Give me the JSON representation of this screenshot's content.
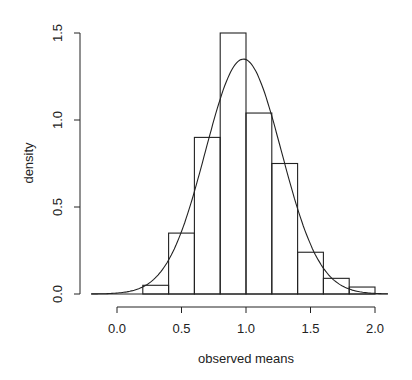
{
  "chart_data": {
    "type": "bar",
    "subtype": "histogram_with_density_curve",
    "title": "",
    "xlabel": "observed means",
    "ylabel": "density",
    "xlim": [
      -0.2,
      2.1
    ],
    "ylim": [
      0,
      1.5
    ],
    "x_ticks": [
      0.0,
      0.5,
      1.0,
      1.5,
      2.0
    ],
    "x_tick_labels": [
      "0.0",
      "0.5",
      "1.0",
      "1.5",
      "2.0"
    ],
    "y_ticks": [
      0.0,
      0.5,
      1.0,
      1.5
    ],
    "y_tick_labels": [
      "0.0",
      "0.5",
      "1.0",
      "1.5"
    ],
    "grid": false,
    "legend": null,
    "bin_width": 0.2,
    "bins": [
      {
        "left": 0.2,
        "right": 0.4,
        "density": 0.05
      },
      {
        "left": 0.4,
        "right": 0.6,
        "density": 0.35
      },
      {
        "left": 0.6,
        "right": 0.8,
        "density": 0.9
      },
      {
        "left": 0.8,
        "right": 1.0,
        "density": 1.5
      },
      {
        "left": 1.0,
        "right": 1.2,
        "density": 1.04
      },
      {
        "left": 1.2,
        "right": 1.4,
        "density": 0.75
      },
      {
        "left": 1.4,
        "right": 1.6,
        "density": 0.24
      },
      {
        "left": 1.6,
        "right": 1.8,
        "density": 0.09
      },
      {
        "left": 1.8,
        "right": 2.0,
        "density": 0.04
      }
    ],
    "categories": [
      "0.2-0.4",
      "0.4-0.6",
      "0.6-0.8",
      "0.8-1.0",
      "1.0-1.2",
      "1.2-1.4",
      "1.4-1.6",
      "1.6-1.8",
      "1.8-2.0"
    ],
    "values": [
      0.05,
      0.35,
      0.9,
      1.5,
      1.04,
      0.75,
      0.24,
      0.09,
      0.04
    ],
    "curve": {
      "name": "normal density",
      "mean": 0.98,
      "sd": 0.295,
      "peak": 1.35,
      "x_range": [
        -0.2,
        2.1
      ]
    }
  }
}
